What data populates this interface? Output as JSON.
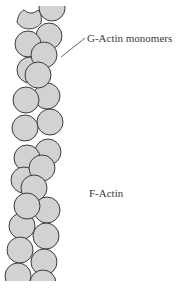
{
  "figure": {
    "labels": {
      "monomer_label": "G-Actin monomers",
      "filament_label": "F-Actin"
    },
    "colors": {
      "monomer_fill": "#d2d2d2",
      "monomer_stroke": "#3c3c3c",
      "label_text": "#3a3a3a",
      "leader_line": "#555555",
      "background": "#ffffff"
    }
  }
}
